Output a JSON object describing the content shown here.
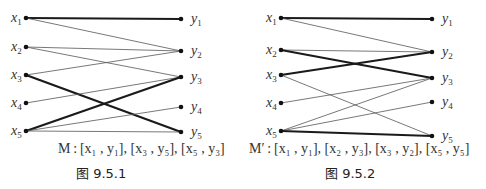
{
  "figures": [
    {
      "id": "fig1",
      "caption": "M : [x₁ , y₁], [x₃ , y₅], [x₅ , y₃]",
      "figure_label": "图 9.5.1",
      "left_nodes": [
        "x1",
        "x2",
        "x3",
        "x4",
        "x5"
      ],
      "right_nodes": [
        "y1",
        "y2",
        "y3",
        "y4",
        "y5"
      ],
      "edges": [
        {
          "from": "x1",
          "to": "y1",
          "matched": true
        },
        {
          "from": "x1",
          "to": "y2",
          "matched": false
        },
        {
          "from": "x2",
          "to": "y2",
          "matched": false
        },
        {
          "from": "x2",
          "to": "y3",
          "matched": false
        },
        {
          "from": "x3",
          "to": "y2",
          "matched": false
        },
        {
          "from": "x3",
          "to": "y5",
          "matched": true
        },
        {
          "from": "x4",
          "to": "y3",
          "matched": false
        },
        {
          "from": "x5",
          "to": "y3",
          "matched": true
        },
        {
          "from": "x5",
          "to": "y4",
          "matched": false
        },
        {
          "from": "x5",
          "to": "y5",
          "matched": false
        }
      ]
    },
    {
      "id": "fig2",
      "caption": "M′ : [x₁ , y₁], [x₂ , y₃], [x₃ , y₂], [x₅ , y₅]",
      "figure_label": "图 9.5.2",
      "left_nodes": [
        "x1",
        "x2",
        "x3",
        "x4",
        "x5"
      ],
      "right_nodes": [
        "y1",
        "y2",
        "y3",
        "y4",
        "y5"
      ],
      "edges": [
        {
          "from": "x1",
          "to": "y1",
          "matched": true
        },
        {
          "from": "x1",
          "to": "y2",
          "matched": false
        },
        {
          "from": "x2",
          "to": "y2",
          "matched": false
        },
        {
          "from": "x2",
          "to": "y3",
          "matched": true
        },
        {
          "from": "x3",
          "to": "y2",
          "matched": true
        },
        {
          "from": "x3",
          "to": "y5",
          "matched": false
        },
        {
          "from": "x4",
          "to": "y3",
          "matched": false
        },
        {
          "from": "x5",
          "to": "y3",
          "matched": false
        },
        {
          "from": "x5",
          "to": "y4",
          "matched": false
        },
        {
          "from": "x5",
          "to": "y5",
          "matched": true
        }
      ]
    }
  ]
}
